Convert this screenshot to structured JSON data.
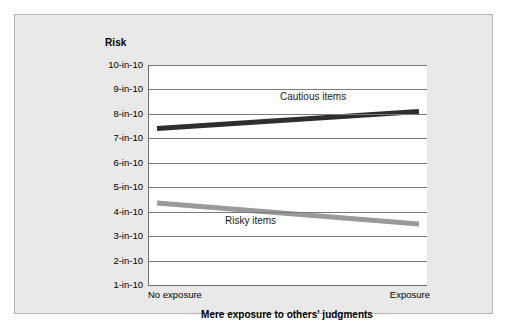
{
  "chart_data": {
    "type": "line",
    "title": "",
    "xlabel": "Mere exposure to others' judgments",
    "ylabel": "Risk",
    "categories": [
      "No exposure",
      "Exposure"
    ],
    "x_tick_labels": [
      "No exposure",
      "Exposure"
    ],
    "y_tick_labels": [
      "10-in-10",
      "9-in-10",
      "8-in-10",
      "7-in-10",
      "6-in-10",
      "5-in-10",
      "4-in-10",
      "3-in-10",
      "2-in-10",
      "1-in-10"
    ],
    "y_tick_values": [
      10,
      9,
      8,
      7,
      6,
      5,
      4,
      3,
      2,
      1
    ],
    "ylim": [
      1,
      10
    ],
    "grid": true,
    "legend": "inline-labels",
    "series": [
      {
        "name": "Cautious items",
        "values": [
          7.4,
          8.1
        ],
        "color": "#2e2e2e"
      },
      {
        "name": "Risky items",
        "values": [
          4.35,
          3.5
        ],
        "color": "#9a9a9a"
      }
    ],
    "annotations": [
      {
        "text": "Cautious items",
        "series": "Cautious items"
      },
      {
        "text": "Risky items",
        "series": "Risky items"
      }
    ]
  },
  "panel": {
    "background_color": "#e9e9e9",
    "border_color": "#b4b4b4"
  },
  "axes": {
    "line_color": "#6e6e6e",
    "grid_color": "#7a7a7a",
    "plot_background": "#ffffff"
  }
}
